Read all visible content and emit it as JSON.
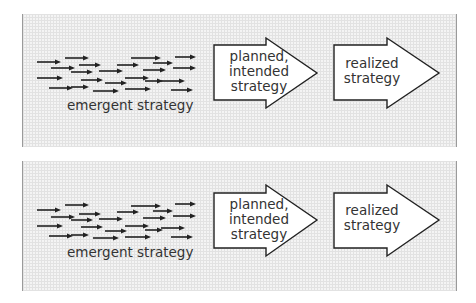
{
  "diagram": {
    "panels": [
      {
        "id": "top",
        "top": 14,
        "height": 133,
        "emergent_label": "emergent strategy",
        "planned_label_lines": [
          "planned,",
          "intended",
          "strategy"
        ],
        "realized_label_lines": [
          "realized",
          "strategy"
        ],
        "big_arrow_1": {
          "body_left": 191,
          "body_top": 31,
          "body_bottom": 86,
          "head_x": 243,
          "head_top": 24,
          "head_bottom": 94,
          "tip_x": 294,
          "tip_y": 59
        },
        "big_arrow_2": {
          "body_left": 311,
          "body_top": 31,
          "body_bottom": 86,
          "head_x": 364,
          "head_top": 24,
          "head_bottom": 94,
          "tip_x": 416,
          "tip_y": 59
        },
        "small_arrows": [
          [
            14,
            48,
            38
          ],
          [
            42,
            44,
            66
          ],
          [
            108,
            44,
            138
          ],
          [
            152,
            43,
            173
          ],
          [
            56,
            51,
            78
          ],
          [
            94,
            51,
            116
          ],
          [
            130,
            49,
            150
          ],
          [
            28,
            54,
            52
          ],
          [
            48,
            58,
            70
          ],
          [
            76,
            57,
            100
          ],
          [
            120,
            56,
            143
          ],
          [
            150,
            54,
            173
          ],
          [
            14,
            64,
            40
          ],
          [
            58,
            66,
            80
          ],
          [
            102,
            64,
            126
          ],
          [
            82,
            69,
            104
          ],
          [
            122,
            67,
            140
          ],
          [
            138,
            67,
            162
          ],
          [
            26,
            74,
            50
          ],
          [
            48,
            73,
            66
          ],
          [
            70,
            77,
            96
          ],
          [
            102,
            75,
            128
          ],
          [
            148,
            76,
            170
          ]
        ]
      },
      {
        "id": "bottom",
        "top": 161,
        "height": 130,
        "emergent_label": "emergent strategy",
        "planned_label_lines": [
          "planned,",
          "intended",
          "strategy"
        ],
        "realized_label_lines": [
          "realized",
          "strategy"
        ],
        "big_arrow_1": {
          "body_left": 191,
          "body_top": 32,
          "body_bottom": 87,
          "head_x": 243,
          "head_top": 24,
          "head_bottom": 95,
          "tip_x": 294,
          "tip_y": 59
        },
        "big_arrow_2": {
          "body_left": 311,
          "body_top": 32,
          "body_bottom": 87,
          "head_x": 364,
          "head_top": 24,
          "head_bottom": 95,
          "tip_x": 416,
          "tip_y": 59
        },
        "small_arrows": [
          [
            14,
            49,
            38
          ],
          [
            42,
            44,
            66
          ],
          [
            108,
            45,
            138
          ],
          [
            152,
            43,
            173
          ],
          [
            56,
            53,
            78
          ],
          [
            94,
            51,
            116
          ],
          [
            130,
            50,
            150
          ],
          [
            28,
            56,
            52
          ],
          [
            48,
            59,
            70
          ],
          [
            76,
            58,
            100
          ],
          [
            120,
            57,
            143
          ],
          [
            150,
            55,
            173
          ],
          [
            14,
            65,
            40
          ],
          [
            58,
            66,
            80
          ],
          [
            102,
            65,
            126
          ],
          [
            82,
            70,
            104
          ],
          [
            122,
            69,
            140
          ],
          [
            138,
            67,
            162
          ],
          [
            26,
            75,
            50
          ],
          [
            48,
            74,
            66
          ],
          [
            70,
            77,
            96
          ],
          [
            102,
            76,
            128
          ],
          [
            148,
            76,
            170
          ]
        ]
      }
    ],
    "colors": {
      "stroke": "#222222",
      "arrow_fill": "#ffffff",
      "text": "#333333",
      "panel_border": "#9a9a9a"
    }
  }
}
